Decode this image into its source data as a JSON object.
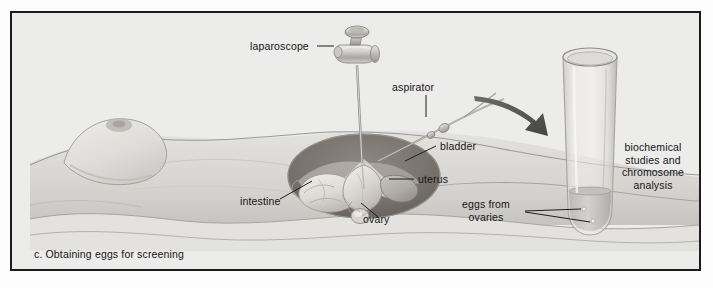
{
  "figure": {
    "caption": "c. Obtaining eggs for screening",
    "background_color": "#ececeb",
    "frame_color": "#1c1c1c",
    "ink_color": "#151515"
  },
  "labels": {
    "laparoscope": "laparoscope",
    "aspirator": "aspirator",
    "bladder": "bladder",
    "uterus": "uterus",
    "intestine": "intestine",
    "ovary": "ovary",
    "eggs_from_ovaries_line1": "eggs from",
    "eggs_from_ovaries_line2": "ovaries",
    "analysis_line1": "biochemical",
    "analysis_line2": "studies and",
    "analysis_line3": "chromosome",
    "analysis_line4": "analysis"
  },
  "scene": {
    "patient": "supine female torso",
    "instrument": "laparoscope with eyepiece and trocar shaft",
    "tool": "aspirator needle tube",
    "vessel": "test tube with collected eggs",
    "arrow": "transfer arrow to test tube"
  }
}
